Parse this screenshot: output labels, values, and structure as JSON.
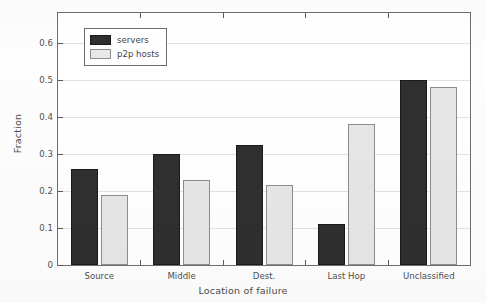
{
  "chart_data": {
    "type": "bar",
    "title": "",
    "xlabel": "Location of failure",
    "ylabel": "Fraction",
    "categories": [
      "Source",
      "Middle",
      "Dest.",
      "Last Hop",
      "Unclassified"
    ],
    "series": [
      {
        "name": "servers",
        "color": "#2f2f2f",
        "values": [
          0.26,
          0.3,
          0.325,
          0.11,
          0.5
        ]
      },
      {
        "name": "p2p hosts",
        "color": "#e6e6e6",
        "values": [
          0.19,
          0.23,
          0.215,
          0.38,
          0.48
        ]
      }
    ],
    "ylim": [
      0,
      0.68
    ],
    "yticks": [
      0,
      0.1,
      0.2,
      0.3,
      0.4,
      0.5,
      0.6
    ],
    "ytick_labels": [
      "0",
      "0.1",
      "0.2",
      "0.3",
      "0.4",
      "0.5",
      "0.6"
    ],
    "grid": true,
    "grid_axis": "y",
    "legend_position": "upper left",
    "frame": true
  },
  "legend": {
    "entries": [
      {
        "label": "servers"
      },
      {
        "label": "p2p hosts"
      }
    ]
  },
  "axes": {
    "y_title": "Fraction",
    "x_title": "Location of failure"
  }
}
